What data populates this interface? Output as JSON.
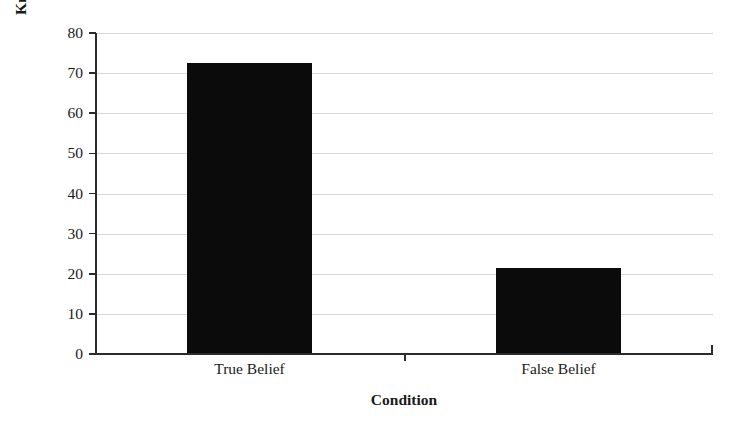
{
  "chart_data": {
    "type": "bar",
    "title": "",
    "categories": [
      "True Belief",
      "False Belief"
    ],
    "values": [
      72.5,
      21.5
    ],
    "xlabel": "Condition",
    "ylabel": "Knowledge Attribution Percentage",
    "ylim": [
      0,
      80
    ],
    "ytick_labels": [
      "0",
      "10",
      "20",
      "30",
      "40",
      "50",
      "60",
      "70",
      "80"
    ],
    "ytick_values": [
      0,
      10,
      20,
      30,
      40,
      50,
      60,
      70,
      80
    ],
    "grid": "horizontal",
    "legend": "none",
    "bar_color": "#0b0b0b",
    "gridline_color": "#d8d8d8",
    "axis_color": "#2b2b2b",
    "background_color": "#ffffff"
  }
}
